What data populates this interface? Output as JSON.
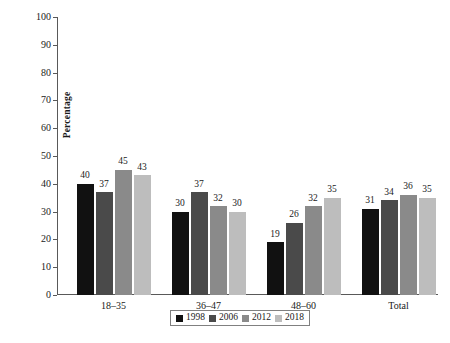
{
  "chart_data": {
    "type": "bar",
    "title": "",
    "xlabel": "",
    "ylabel": "Percentage",
    "ylim": [
      0,
      100
    ],
    "ytick_step": 10,
    "yticks": [
      100,
      90,
      80,
      70,
      60,
      50,
      40,
      30,
      20,
      10,
      0
    ],
    "grid": false,
    "legend_position": "bottom-center",
    "categories": [
      "18–35",
      "36–47",
      "48–60",
      "Total"
    ],
    "series": [
      {
        "name": "1998",
        "color": "#111111",
        "values": [
          40,
          30,
          19,
          31
        ]
      },
      {
        "name": "2006",
        "color": "#4a4a4a",
        "values": [
          37,
          37,
          26,
          34
        ]
      },
      {
        "name": "2012",
        "color": "#8a8a8a",
        "values": [
          45,
          32,
          32,
          36
        ]
      },
      {
        "name": "2018",
        "color": "#bdbdbd",
        "values": [
          43,
          30,
          35,
          35
        ]
      }
    ]
  },
  "axis": {
    "y_title": "Percentage"
  }
}
